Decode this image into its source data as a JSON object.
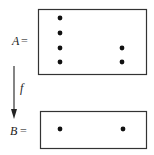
{
  "diagram": {
    "type": "set-mapping",
    "sets": [
      {
        "name": "A",
        "label": "A",
        "equals": "=",
        "box": {
          "x": 38,
          "y": 9,
          "width": 108,
          "height": 65
        },
        "points": [
          {
            "x": 60,
            "y": 18
          },
          {
            "x": 60,
            "y": 33
          },
          {
            "x": 60,
            "y": 48
          },
          {
            "x": 60,
            "y": 62
          },
          {
            "x": 122,
            "y": 48
          },
          {
            "x": 122,
            "y": 62
          }
        ]
      },
      {
        "name": "B",
        "label": "B",
        "equals": "=",
        "box": {
          "x": 40,
          "y": 111,
          "width": 106,
          "height": 37
        },
        "points": [
          {
            "x": 60,
            "y": 129
          },
          {
            "x": 123,
            "y": 129
          }
        ]
      }
    ],
    "arrow": {
      "label": "f",
      "from": {
        "x": 14,
        "y": 66
      },
      "to": {
        "x": 14,
        "y": 118
      }
    },
    "colors": {
      "stroke": "#333333",
      "dot": "#111111",
      "text": "#222222"
    }
  }
}
